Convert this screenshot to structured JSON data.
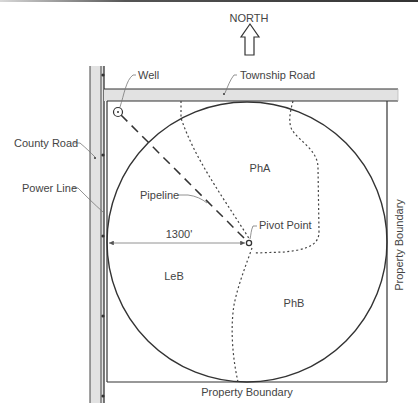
{
  "compass": {
    "label": "NORTH"
  },
  "labels": {
    "well": "Well",
    "township_road": "Township Road",
    "county_road": "County Road",
    "power_line": "Power Line",
    "pipeline": "Pipeline",
    "pivot_point": "Pivot Point",
    "dimension": "1300'",
    "property_boundary_bottom": "Property Boundary",
    "property_boundary_right": "Property Boundary"
  },
  "soil_zones": [
    {
      "id": "PhA",
      "label": "PhA"
    },
    {
      "id": "LeB",
      "label": "LeB"
    },
    {
      "id": "PhB",
      "label": "PhB"
    }
  ],
  "colors": {
    "line": "#333333",
    "road_fill": "#e2e2e2",
    "text": "#444444",
    "background": "#ffffff"
  }
}
